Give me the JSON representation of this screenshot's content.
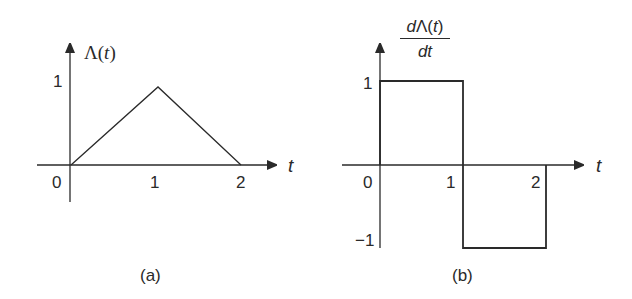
{
  "figure": {
    "panels": [
      {
        "id": "a",
        "caption": "(a)",
        "y_label": "Λ(t)",
        "y_label_prefix": "Λ(",
        "y_label_var": "t",
        "y_label_suffix": ")",
        "x_label": "t",
        "x_ticks": [
          "0",
          "1",
          "2"
        ],
        "y_ticks": [
          "1"
        ],
        "curve": {
          "type": "triangle",
          "points": [
            [
              0,
              0
            ],
            [
              1,
              1
            ],
            [
              2,
              0
            ]
          ]
        }
      },
      {
        "id": "b",
        "caption": "(b)",
        "y_label_numerator": "dΛ(t)",
        "y_label_num_d": "d",
        "y_label_num_rest": "Λ(",
        "y_label_num_var": "t",
        "y_label_num_close": ")",
        "y_label_denominator": "dt",
        "x_label": "t",
        "x_ticks": [
          "0",
          "1",
          "2"
        ],
        "y_ticks": [
          "1",
          "−1"
        ],
        "curve": {
          "type": "step",
          "points": [
            [
              0,
              0
            ],
            [
              0,
              1
            ],
            [
              1,
              1
            ],
            [
              1,
              -1
            ],
            [
              2,
              -1
            ],
            [
              2,
              0
            ]
          ]
        }
      }
    ],
    "colors": {
      "ink": "#2a2a2a",
      "background": "#ffffff"
    }
  }
}
